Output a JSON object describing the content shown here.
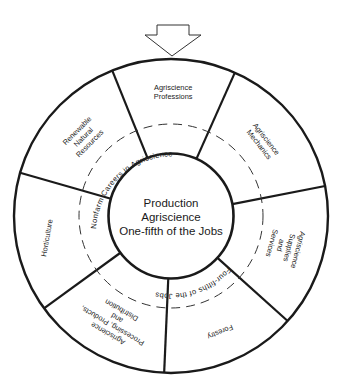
{
  "diagram": {
    "title_lines": [
      "Production",
      "Agriscience",
      "One-fifth of the Jobs"
    ],
    "geometry": {
      "cx": 171,
      "cy": 216,
      "outer_r": 157,
      "dashed_r": 92,
      "inner_r": 62.5
    },
    "arrow": {
      "points": "157,25 189,25 189,35 201,35 172,56 145,35 157,35 157,25"
    },
    "dividers_deg": [
      248,
      294,
      349,
      42,
      92.5,
      144,
      196
    ],
    "segments": [
      {
        "id": "agriscience-professions",
        "lines": [
          "Agriscience",
          "Professions"
        ],
        "angle": 271,
        "radius": 124,
        "rotate": 0
      },
      {
        "id": "agriscience-mechanics",
        "lines": [
          "Agriscience",
          "Mechanics"
        ],
        "angle": 321,
        "radius": 118,
        "rotate": 52
      },
      {
        "id": "agriscience-supplies-services",
        "lines": [
          "Agriscience",
          "Supplies",
          "and",
          "Services"
        ],
        "angle": 15,
        "radius": 118,
        "rotate": 105
      },
      {
        "id": "forestry",
        "lines": [
          "Forestry"
        ],
        "angle": 67,
        "radius": 126,
        "rotate": 157
      },
      {
        "id": "agriscience-processing",
        "lines": [
          "Agriscience",
          "Processing, Products,",
          "and",
          "Distribution"
        ],
        "angle": 118,
        "radius": 120,
        "rotate": 210
      },
      {
        "id": "horticulture",
        "lines": [
          "Horticulture"
        ],
        "angle": 170,
        "radius": 126,
        "rotate": -80
      },
      {
        "id": "renewable-natural-resources",
        "lines": [
          "Renewable",
          "Natural",
          "Resources"
        ],
        "angle": 222,
        "radius": 118,
        "rotate": -45
      }
    ],
    "arc_texts": {
      "top": "Nonfarm    Careers    in    Agriscience",
      "bottom": "Four-fifths  of the Jobs"
    }
  }
}
